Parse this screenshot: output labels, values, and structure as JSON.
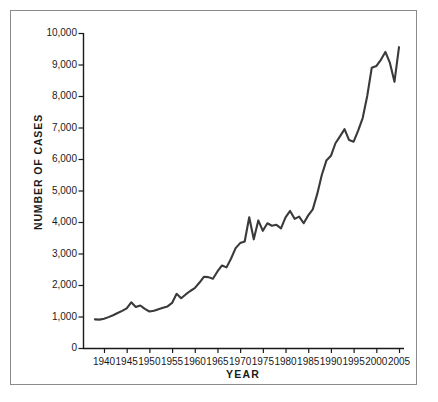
{
  "chart_data": {
    "type": "line",
    "title": "",
    "xlabel": "YEAR",
    "ylabel": "NUMBER OF CASES",
    "xlim": [
      1938,
      2005
    ],
    "ylim": [
      0,
      10000
    ],
    "grid": false,
    "legend": null,
    "line_color": "#3a3a3a",
    "background_color": "#ffffff",
    "frame_color": "#8a8a8a",
    "text_color": "#1a1a1a",
    "ytick_labels": [
      "10,000",
      "9,000",
      "8,000",
      "7,000",
      "6,000",
      "5,000",
      "4,000",
      "3,000",
      "2,000",
      "1,000",
      "0"
    ],
    "ytick_values": [
      10000,
      9000,
      8000,
      7000,
      6000,
      5000,
      4000,
      3000,
      2000,
      1000,
      0
    ],
    "xtick_labels": [
      "1940",
      "1945",
      "1950",
      "1955",
      "1960",
      "1965",
      "1970",
      "1975",
      "1980",
      "1985",
      "1990",
      "1995",
      "2000",
      "2005"
    ],
    "xtick_values": [
      1940,
      1945,
      1950,
      1955,
      1960,
      1965,
      1970,
      1975,
      1980,
      1985,
      1990,
      1995,
      2000,
      2005
    ],
    "series": [
      {
        "name": "Number of cases",
        "x": [
          1938,
          1939,
          1940,
          1941,
          1942,
          1943,
          1944,
          1945,
          1946,
          1947,
          1948,
          1949,
          1950,
          1951,
          1952,
          1953,
          1954,
          1955,
          1956,
          1957,
          1958,
          1959,
          1960,
          1961,
          1962,
          1963,
          1964,
          1965,
          1966,
          1967,
          1968,
          1969,
          1970,
          1971,
          1972,
          1973,
          1974,
          1975,
          1976,
          1977,
          1978,
          1979,
          1980,
          1981,
          1982,
          1983,
          1984,
          1985,
          1986,
          1987,
          1988,
          1989,
          1990,
          1991,
          1992,
          1993,
          1994,
          1995,
          1996,
          1997,
          1998,
          1999,
          2000,
          2001,
          2002,
          2003,
          2004,
          2005
        ],
        "y": [
          910,
          900,
          930,
          980,
          1040,
          1110,
          1180,
          1260,
          1450,
          1300,
          1350,
          1240,
          1160,
          1180,
          1230,
          1280,
          1320,
          1430,
          1720,
          1580,
          1700,
          1810,
          1900,
          2070,
          2260,
          2250,
          2200,
          2430,
          2620,
          2560,
          2840,
          3170,
          3330,
          3380,
          4150,
          3450,
          4050,
          3720,
          3960,
          3880,
          3910,
          3800,
          4150,
          4350,
          4100,
          4170,
          3960,
          4210,
          4400,
          4900,
          5500,
          5950,
          6100,
          6500,
          6720,
          6950,
          6600,
          6550,
          6900,
          7300,
          8000,
          8900,
          8950,
          9150,
          9400,
          9050,
          8450,
          9550
        ]
      }
    ]
  },
  "axis": {
    "ylabel_text": "NUMBER OF CASES",
    "xlabel_text": "YEAR"
  }
}
